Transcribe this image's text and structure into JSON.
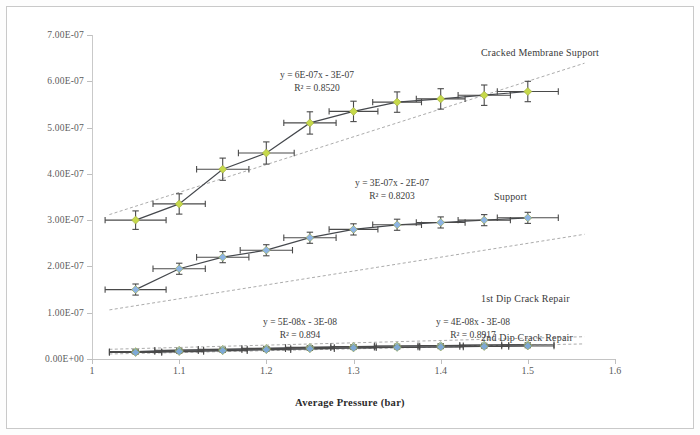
{
  "chart_data": {
    "type": "scatter",
    "title": "",
    "xlabel": "Average Pressure (bar)",
    "ylabel": "Permeance (mol/m².s⁻¹.Pa⁻¹)",
    "xlim": [
      1,
      1.6
    ],
    "ylim": [
      0,
      7e-07
    ],
    "xticks": [
      "1",
      "1.1",
      "1.2",
      "1.3",
      "1.4",
      "1.5",
      "1.6"
    ],
    "xtick_values": [
      1,
      1.1,
      1.2,
      1.3,
      1.4,
      1.5,
      1.6
    ],
    "yticks": [
      "0.00E+00",
      "1.00E-07",
      "2.00E-07",
      "3.00E-07",
      "4.00E-07",
      "5.00E-07",
      "6.00E-07",
      "7.00E-07"
    ],
    "ytick_values": [
      0,
      1e-07,
      2e-07,
      3e-07,
      4e-07,
      5e-07,
      6e-07,
      7e-07
    ],
    "grid": false,
    "legend_position": "inline-right-labels",
    "error_bars": true,
    "series": [
      {
        "name": "Cracked Membrane Support",
        "color": "#c6d94a",
        "marker": "diamond",
        "x": [
          1.05,
          1.1,
          1.15,
          1.2,
          1.25,
          1.3,
          1.35,
          1.4,
          1.45,
          1.5
        ],
        "y": [
          3e-07,
          3.35e-07,
          4.1e-07,
          4.45e-07,
          5.1e-07,
          5.35e-07,
          5.55e-07,
          5.62e-07,
          5.7e-07,
          5.78e-07
        ],
        "xerr": [
          0.035,
          0.03,
          0.03,
          0.032,
          0.03,
          0.028,
          0.028,
          0.028,
          0.03,
          0.035
        ],
        "yerr": [
          2e-08,
          2.2e-08,
          2.4e-08,
          2.4e-08,
          2.4e-08,
          2.2e-08,
          2.2e-08,
          2.2e-08,
          2.2e-08,
          2.2e-08
        ],
        "trendline": {
          "equation": "y = 6E-07x - 3E-07",
          "r2": "R² = 0.8520",
          "slope": 6e-07,
          "intercept": -3e-07
        }
      },
      {
        "name": "Support",
        "color": "#8db4e3",
        "marker": "diamond",
        "x": [
          1.05,
          1.1,
          1.15,
          1.2,
          1.25,
          1.3,
          1.35,
          1.4,
          1.45,
          1.5
        ],
        "y": [
          1.5e-07,
          1.95e-07,
          2.2e-07,
          2.35e-07,
          2.62e-07,
          2.8e-07,
          2.9e-07,
          2.95e-07,
          3e-07,
          3.05e-07
        ],
        "xerr": [
          0.035,
          0.03,
          0.03,
          0.03,
          0.03,
          0.028,
          0.028,
          0.028,
          0.03,
          0.035
        ],
        "yerr": [
          1.2e-08,
          1.2e-08,
          1.2e-08,
          1.2e-08,
          1.2e-08,
          1.2e-08,
          1.2e-08,
          1.2e-08,
          1.2e-08,
          1.2e-08
        ],
        "trendline": {
          "equation": "y = 3E-07x - 2E-07",
          "r2": "R² = 0.8203",
          "slope": 3e-07,
          "intercept": -2e-07
        }
      },
      {
        "name": "1st Dip Crack Repair",
        "color": "#9fc5e8",
        "marker": "diamond",
        "x": [
          1.05,
          1.1,
          1.15,
          1.2,
          1.25,
          1.3,
          1.35,
          1.4,
          1.45,
          1.5
        ],
        "y": [
          1.6e-08,
          1.9e-08,
          2.1e-08,
          2.3e-08,
          2.5e-08,
          2.7e-08,
          2.8e-08,
          2.9e-08,
          3e-08,
          3.1e-08
        ],
        "xerr": [
          0.03,
          0.028,
          0.028,
          0.028,
          0.028,
          0.026,
          0.026,
          0.026,
          0.028,
          0.03
        ],
        "yerr": [
          4e-09,
          4e-09,
          4e-09,
          4e-09,
          4e-09,
          4e-09,
          4e-09,
          4e-09,
          4e-09,
          4e-09
        ],
        "trendline": {
          "equation": "y = 5E-08x - 3E-08",
          "r2": "R² = 0.894",
          "slope": 5e-08,
          "intercept": -3e-08
        }
      },
      {
        "name": "2nd Dip Crack Repair",
        "color": "#7ea9d6",
        "marker": "diamond",
        "x": [
          1.05,
          1.1,
          1.15,
          1.2,
          1.25,
          1.3,
          1.35,
          1.4,
          1.45,
          1.5
        ],
        "y": [
          1.4e-08,
          1.6e-08,
          1.8e-08,
          2e-08,
          2.2e-08,
          2.4e-08,
          2.5e-08,
          2.6e-08,
          2.7e-08,
          2.8e-08
        ],
        "xerr": [
          0.03,
          0.028,
          0.028,
          0.028,
          0.028,
          0.026,
          0.026,
          0.026,
          0.028,
          0.03
        ],
        "yerr": [
          3.5e-09,
          3.5e-09,
          3.5e-09,
          3.5e-09,
          3.5e-09,
          3.5e-09,
          3.5e-09,
          3.5e-09,
          3.5e-09,
          3.5e-09
        ],
        "trendline": {
          "equation": "y = 4E-08x - 3E-08",
          "r2": "R² = 0.8917",
          "slope": 4e-08,
          "intercept": -3e-08
        }
      }
    ],
    "annotations": [
      {
        "id": "eq-cracked",
        "text_line1": "y = 6E-07x - 3E-07",
        "text_line2": "R² = 0.8520",
        "x_px": 310,
        "y_px": 62
      },
      {
        "id": "eq-support",
        "text_line1": "y = 3E-07x - 2E-07",
        "text_line2": "R² = 0.8203",
        "x_px": 385,
        "y_px": 170
      },
      {
        "id": "eq-dip1",
        "text_line1": "y = 5E-08x - 3E-08",
        "text_line2": "R² = 0.894",
        "x_px": 293,
        "y_px": 309
      },
      {
        "id": "eq-dip2",
        "text_line1": "y = 4E-08x - 3E-08",
        "text_line2": "R² = 0.8917",
        "x_px": 466,
        "y_px": 309
      }
    ],
    "series_labels": [
      {
        "id": "label-cracked",
        "text": "Cracked Membrane Support",
        "x_px": 474,
        "y_px": 40
      },
      {
        "id": "label-support",
        "text": "Support",
        "x_px": 487,
        "y_px": 184
      },
      {
        "id": "label-dip1",
        "text": "1st Dip Crack Repair",
        "x_px": 474,
        "y_px": 286
      },
      {
        "id": "label-dip2",
        "text": "2nd Dip Crack Repair",
        "x_px": 474,
        "y_px": 325
      }
    ],
    "colors": {
      "cracked_membrane": "#c6d94a",
      "support": "#8db4e3",
      "dip1": "#9fc5e8",
      "dip2": "#7ea9d6",
      "error_bar": "#4a4a4a",
      "trendline": "#8c8c8c",
      "axis": "#bfbfbf",
      "text": "#3b3b3b"
    }
  }
}
